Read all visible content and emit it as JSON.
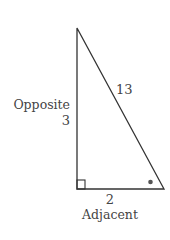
{
  "diagram": {
    "type": "right-triangle",
    "stroke_color": "#333333",
    "label_color": "#444444",
    "sides": {
      "opposite": {
        "label": "Opposite",
        "value": "3"
      },
      "adjacent": {
        "label": "Adjacent",
        "value": "2"
      },
      "hypotenuse": {
        "value": "13"
      }
    },
    "markers": {
      "right_angle": "bottom-left",
      "angle_dot": "bottom-right"
    }
  }
}
